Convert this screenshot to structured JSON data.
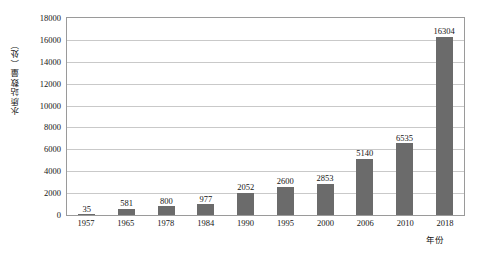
{
  "chart_data": {
    "type": "bar",
    "title": "",
    "subtitle": "",
    "xlabel": "年份",
    "ylabel": "水质站数量（处）",
    "categories": [
      "1957",
      "1965",
      "1978",
      "1984",
      "1990",
      "1995",
      "2000",
      "2006",
      "2010",
      "2018"
    ],
    "values": [
      35,
      581,
      800,
      977,
      2052,
      2600,
      2853,
      5140,
      6535,
      16304
    ],
    "data_labels": [
      "35",
      "581",
      "800",
      "977",
      "2052",
      "2600",
      "2853",
      "5140",
      "6535",
      "16304"
    ],
    "ylim": [
      0,
      18000
    ],
    "ytick_step": 2000,
    "ytick_labels": [
      "18000",
      "16000",
      "14000",
      "12000",
      "10000",
      "8000",
      "6000",
      "4000",
      "2000",
      "0"
    ],
    "grid": "horizontal",
    "legend": "none",
    "series": [
      {
        "name": "水质站数量",
        "values": [
          35,
          581,
          800,
          977,
          2052,
          2600,
          2853,
          5140,
          6535,
          16304
        ]
      }
    ]
  },
  "style": {
    "bar_color": "#6b6b6b",
    "grid_color": "#c9c9c9",
    "frame_color": "#9a9a9a",
    "text_color": "#151515",
    "background": "#ffffff"
  }
}
